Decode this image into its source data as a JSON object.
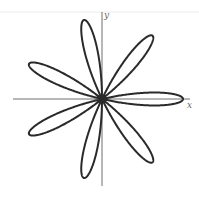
{
  "figure": {
    "curve": {
      "equation": "r = cos(7θ)",
      "petals": 7,
      "k": 7,
      "amplitude": 1,
      "rotation_degrees": 0,
      "color": "#2a2a2a"
    },
    "axes": {
      "x_label": "x",
      "y_label": "y",
      "color": "#6e6e6e"
    }
  }
}
